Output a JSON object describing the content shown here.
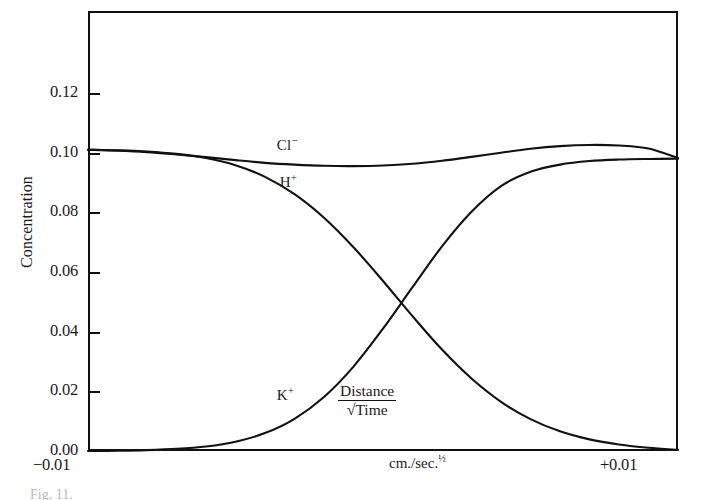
{
  "figure": {
    "caption": "Fig. 11.",
    "y_axis_title": "Concentration",
    "x_unit_label": "cm./sec.",
    "x_unit_exponent": "½",
    "x_label_left": "−0.01",
    "x_label_right": "+0.01",
    "ratio_numerator": "Distance",
    "ratio_radical": "√",
    "ratio_denominator": "Time"
  },
  "series_tags": {
    "chloride": {
      "symbol": "Cl",
      "charge": "−"
    },
    "hydrogen": {
      "symbol": "H",
      "charge": "+"
    },
    "potassium": {
      "symbol": "K",
      "charge": "+"
    }
  },
  "chart_data": {
    "type": "line",
    "title": "",
    "subtitle": "",
    "xlabel": "Distance / √Time  (cm./sec.½)",
    "ylabel": "Concentration",
    "xlim": [
      -0.01,
      0.01
    ],
    "ylim": [
      0.0,
      0.1475
    ],
    "grid": false,
    "legend_position": "inline-curve-labels",
    "x_tick_labels": [
      "−0.01",
      "+0.01"
    ],
    "y_tick_labels": [
      "0.00",
      "0.02",
      "0.04",
      "0.06",
      "0.08",
      "0.10",
      "0.12"
    ],
    "y_ticks": [
      0.0,
      0.02,
      0.04,
      0.06,
      0.08,
      0.1,
      0.12
    ],
    "annotations": [
      {
        "text": "Cl−",
        "x": -0.0036,
        "y": 0.1022
      },
      {
        "text": "H+",
        "x": -0.0035,
        "y": 0.0897
      },
      {
        "text": "K+",
        "x": -0.0036,
        "y": 0.0185
      },
      {
        "text": "Distance/√Time",
        "x": 0.0012,
        "y": 0.0175
      }
    ],
    "x": [
      -0.01,
      -0.009,
      -0.008,
      -0.007,
      -0.006,
      -0.005,
      -0.004,
      -0.003,
      -0.002,
      -0.001,
      0.0,
      0.001,
      0.002,
      0.003,
      0.004,
      0.005,
      0.006,
      0.007,
      0.008,
      0.009,
      0.01
    ],
    "series": [
      {
        "name": "Cl−",
        "values": [
          0.101,
          0.1007,
          0.1002,
          0.0994,
          0.0985,
          0.0975,
          0.0966,
          0.096,
          0.0956,
          0.0955,
          0.0957,
          0.0963,
          0.0973,
          0.0986,
          0.1,
          0.1013,
          0.1022,
          0.1026,
          0.1024,
          0.1014,
          0.0982
        ]
      },
      {
        "name": "H+",
        "values": [
          0.101,
          0.1008,
          0.1004,
          0.0996,
          0.0982,
          0.0958,
          0.0919,
          0.0861,
          0.0782,
          0.0683,
          0.057,
          0.0452,
          0.034,
          0.0243,
          0.0165,
          0.0107,
          0.0066,
          0.0039,
          0.0022,
          0.0011,
          0.0004
        ]
      },
      {
        "name": "K+",
        "values": [
          0.0,
          0.0001,
          0.0003,
          0.0007,
          0.0015,
          0.0031,
          0.006,
          0.0108,
          0.0181,
          0.0283,
          0.041,
          0.0549,
          0.0686,
          0.0802,
          0.0888,
          0.0936,
          0.096,
          0.0972,
          0.0977,
          0.0979,
          0.098
        ]
      }
    ]
  }
}
